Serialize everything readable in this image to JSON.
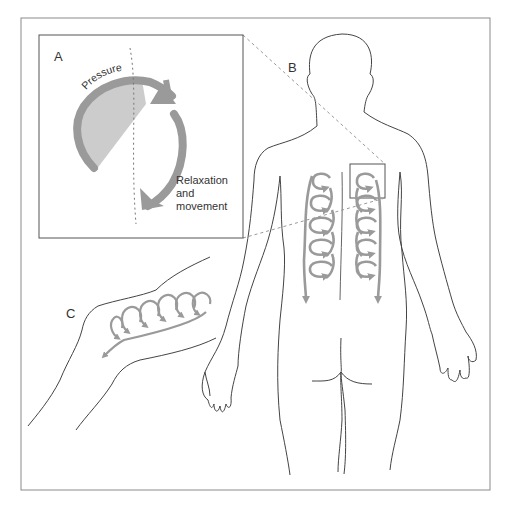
{
  "figure": {
    "panels": {
      "A": {
        "label": "A",
        "pressure_label": "Pressure",
        "relaxation_label_lines": [
          "Relaxation",
          "and",
          "movement"
        ]
      },
      "B": {
        "label": "B"
      },
      "C": {
        "label": "C"
      }
    },
    "colors": {
      "frame": "#8a8a8a",
      "outline": "#444444",
      "arrow": "#9a9a9a",
      "wedge": "#cccccc",
      "dashed": "#9a9a9a"
    }
  }
}
